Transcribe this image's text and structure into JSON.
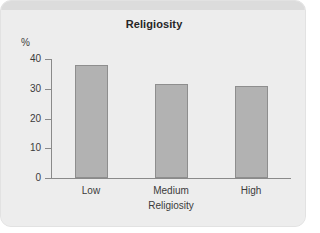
{
  "chart_data": {
    "type": "bar",
    "title": "Religiosity",
    "xlabel": "Religiosity",
    "ylabel": "%",
    "categories": [
      "Low",
      "Medium",
      "High"
    ],
    "values": [
      38,
      31.5,
      30.8
    ],
    "ylim": [
      0,
      40
    ],
    "yticks": [
      "40",
      "30",
      "20",
      "10",
      "0"
    ],
    "grid": false,
    "legend": "none",
    "bar_color": "#b2b2b2",
    "bar_border_color": "#8e8e8e",
    "axis_color": "#8a8a8a",
    "panel_color": "#ededed",
    "top_band_color": "#dcdcdc",
    "text_color": "#3b3b3b"
  }
}
